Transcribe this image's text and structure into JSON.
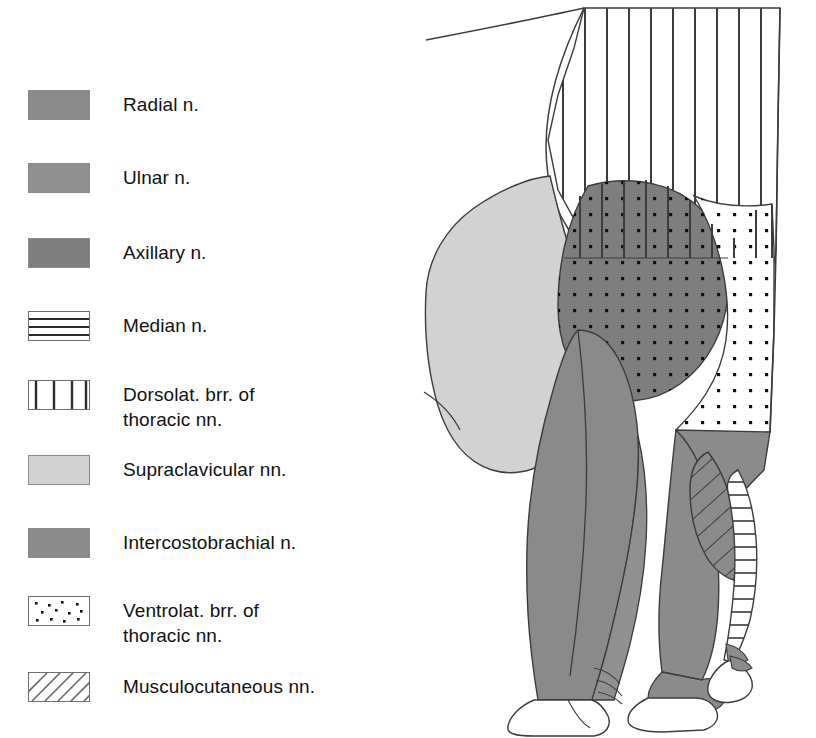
{
  "figure": {
    "kind": "anatomical-diagram"
  },
  "legend": {
    "items": [
      {
        "key": "radial",
        "label": "Radial n.",
        "pattern": "solid",
        "color": "#8a8a8a",
        "swatch_name": "swatch-radial"
      },
      {
        "key": "ulnar",
        "label": "Ulnar n.",
        "pattern": "solid",
        "color": "#909090",
        "swatch_name": "swatch-ulnar"
      },
      {
        "key": "axillary",
        "label": "Axillary n.",
        "pattern": "solid",
        "color": "#7e7e7e",
        "swatch_name": "swatch-axillary"
      },
      {
        "key": "median",
        "label": "Median n.",
        "pattern": "horizontal-lines",
        "color": "#ffffff",
        "swatch_name": "swatch-median"
      },
      {
        "key": "dorsolat_thoracic",
        "label": "Dorsolat. brr. of\nthoracic nn.",
        "pattern": "vertical-lines",
        "color": "#ffffff",
        "swatch_name": "swatch-dorsolateral-thoracic"
      },
      {
        "key": "supraclavicular",
        "label": "Supraclavicular nn.",
        "pattern": "solid",
        "color": "#d2d2d2",
        "swatch_name": "swatch-supraclavicular"
      },
      {
        "key": "intercostobrachial",
        "label": "Intercostobrachial n.",
        "pattern": "solid",
        "color": "#8b8b8b",
        "swatch_name": "swatch-intercostobrachial"
      },
      {
        "key": "ventrolat_thoracic",
        "label": "Ventrolat. brr. of\nthoracic nn.",
        "pattern": "dots",
        "color": "#ffffff",
        "swatch_name": "swatch-ventrolateral-thoracic"
      },
      {
        "key": "musculocutaneous",
        "label": "Musculocutaneous nn.",
        "pattern": "diagonal-lines",
        "color": "#ffffff",
        "swatch_name": "swatch-musculocutaneous"
      }
    ]
  },
  "diagram": {
    "regions": [
      {
        "key": "dorsolat_thoracic",
        "name": "region-dorsolateral-thoracic",
        "pattern": "vertical-lines",
        "fill": "#ffffff"
      },
      {
        "key": "supraclavicular",
        "name": "region-supraclavicular",
        "pattern": "solid",
        "fill": "#d2d2d2"
      },
      {
        "key": "axillary",
        "name": "region-axillary",
        "pattern": "solid",
        "fill": "#7e7e7e"
      },
      {
        "key": "ventrolat_thoracic",
        "name": "region-ventrolateral-thoracic",
        "pattern": "dots",
        "fill": "#ffffff"
      },
      {
        "key": "intercostobrachial",
        "name": "region-intercostobrachial",
        "pattern": "solid",
        "fill": "#8b8b8b"
      },
      {
        "key": "radial",
        "name": "region-radial",
        "pattern": "solid",
        "fill": "#8a8a8a"
      },
      {
        "key": "ulnar",
        "name": "region-ulnar",
        "pattern": "solid",
        "fill": "#909090"
      },
      {
        "key": "musculocutaneous",
        "name": "region-musculocutaneous",
        "pattern": "diagonal-lines",
        "fill": "#ffffff"
      },
      {
        "key": "median",
        "name": "region-median",
        "pattern": "horizontal-lines",
        "fill": "#ffffff"
      }
    ],
    "outline_color": "#3c3c3c"
  },
  "colors": {
    "ink": "#000000",
    "outline": "#3c3c3c",
    "light_gray": "#d2d2d2",
    "mid_gray": "#909090",
    "dark_gray": "#7e7e7e",
    "background": "#ffffff"
  }
}
